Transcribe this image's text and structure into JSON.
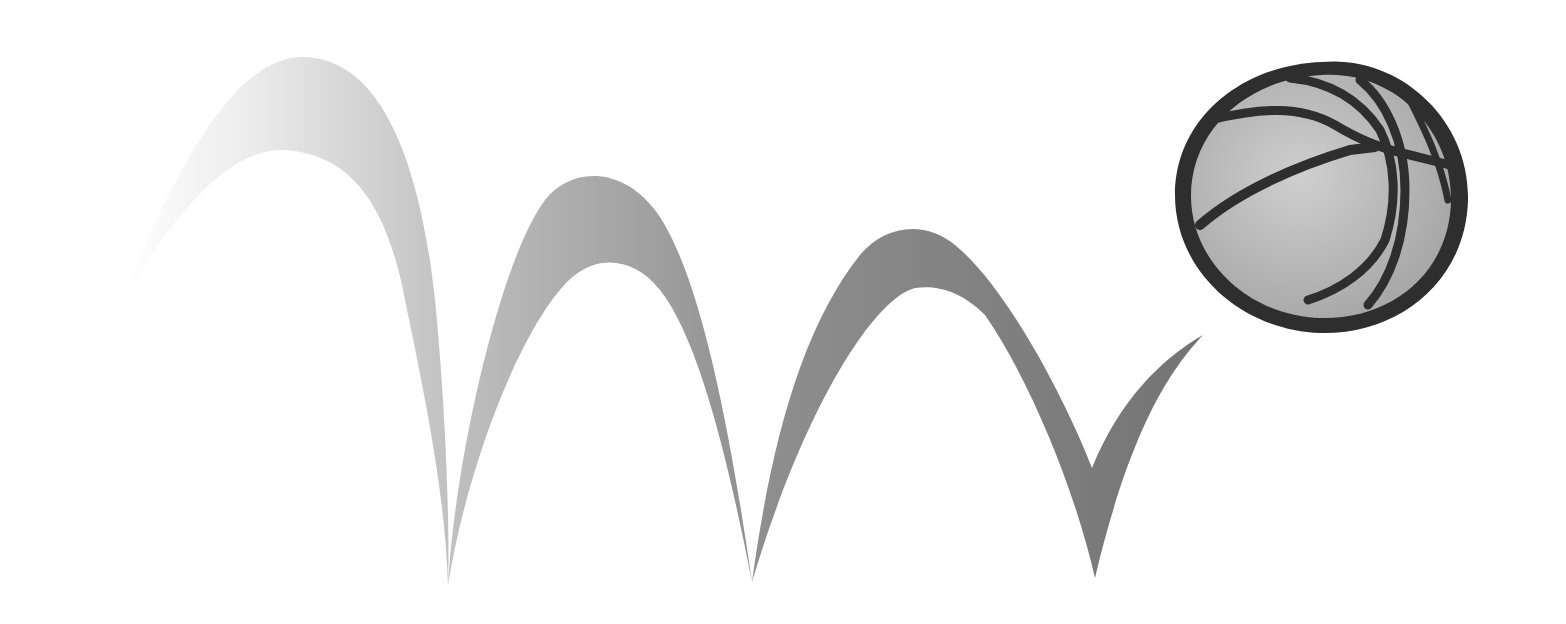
{
  "illustration": {
    "subject": "bouncing basketball",
    "alt": "Illustration of a basketball bouncing, with a fading gray trail of arcs behind it",
    "colors": {
      "background": "#ffffff",
      "trail_start": "#f2f2f2",
      "trail_mid": "#b0b0b0",
      "trail_end": "#7a7a7a",
      "ball_fill": "#b5b5b5",
      "ball_highlight": "#c9c9c9",
      "ball_outline": "#2e2e2e"
    },
    "bounces": 3
  }
}
